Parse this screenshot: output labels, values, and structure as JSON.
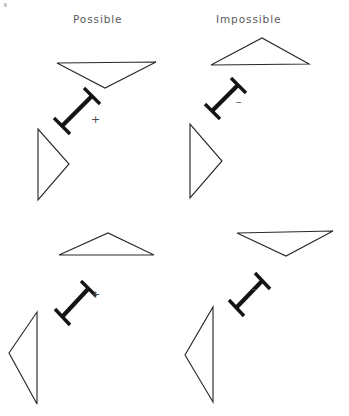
{
  "figure": {
    "background_color": "#ffffff",
    "line_color": "#2b2b2b",
    "bar_color": "#141414",
    "text_color": "#5b5b5b",
    "width": 349,
    "height": 416,
    "columns": [
      {
        "id": "possible",
        "label": "Possible",
        "x": 73
      },
      {
        "id": "impossible",
        "label": "Impossible",
        "x": 216
      }
    ],
    "rows": [
      {
        "id": "row-top"
      },
      {
        "id": "row-bottom"
      }
    ],
    "cells": [
      {
        "id": "cell-top-left",
        "column": "possible",
        "row": "row-top",
        "sign": "+",
        "sign_name": "plus-sign",
        "triangle_orientation": "pointing-down",
        "narrow_triangle_orientation": "pointing-right",
        "bar_orientation": "diagonal-up-right"
      },
      {
        "id": "cell-top-right",
        "column": "impossible",
        "row": "row-top",
        "sign": "–",
        "sign_name": "minus-sign",
        "triangle_orientation": "pointing-up",
        "narrow_triangle_orientation": "pointing-right",
        "bar_orientation": "diagonal-up-right"
      },
      {
        "id": "cell-bottom-left",
        "column": "possible",
        "row": "row-bottom",
        "sign": "+",
        "sign_name": "plus-sign",
        "triangle_orientation": "pointing-up",
        "narrow_triangle_orientation": "pointing-left",
        "bar_orientation": "diagonal-up-right"
      },
      {
        "id": "cell-bottom-right",
        "column": "impossible",
        "row": "row-bottom",
        "sign": "–",
        "sign_name": "minus-sign",
        "triangle_orientation": "pointing-down",
        "narrow_triangle_orientation": "pointing-left",
        "bar_orientation": "diagonal-up-right"
      }
    ]
  }
}
